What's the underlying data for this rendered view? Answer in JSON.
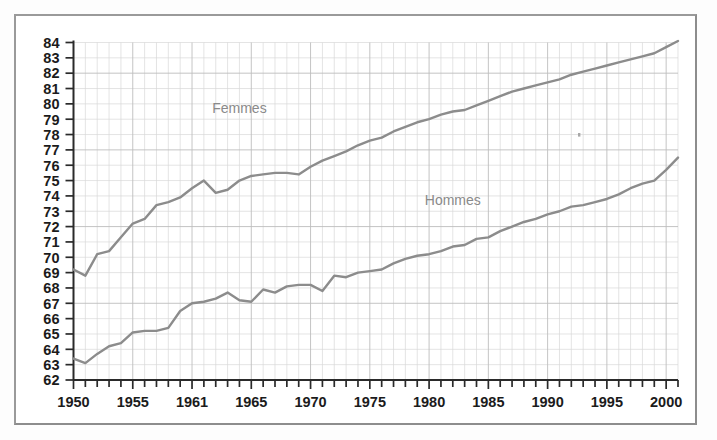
{
  "chart_data": {
    "type": "line",
    "title": "",
    "xlabel": "",
    "ylabel": "",
    "xlim": [
      1950,
      2001
    ],
    "ylim": [
      62,
      84
    ],
    "grid": true,
    "legend_position": "inline-annotation",
    "y_ticks": [
      62,
      63,
      64,
      65,
      66,
      67,
      68,
      69,
      70,
      71,
      72,
      73,
      74,
      75,
      76,
      77,
      78,
      79,
      80,
      81,
      82,
      83,
      84
    ],
    "y_tick_labels": [
      "62",
      "63",
      "64",
      "65",
      "66",
      "67",
      "68",
      "69",
      "70",
      "71",
      "72",
      "73",
      "74",
      "75",
      "76",
      "77",
      "78",
      "79",
      "80",
      "81",
      "82",
      "83",
      "84"
    ],
    "x_ticks": [
      1950,
      1955,
      1960,
      1965,
      1970,
      1975,
      1980,
      1985,
      1990,
      1995,
      2000
    ],
    "x_tick_labels": [
      "1950",
      "1955",
      "1961",
      "1965",
      "1970",
      "1975",
      "1980",
      "1985",
      "1990",
      "1995",
      "2000"
    ],
    "x_minor_tick_interval": 1,
    "x": [
      1950,
      1951,
      1952,
      1953,
      1954,
      1955,
      1956,
      1957,
      1958,
      1959,
      1960,
      1961,
      1962,
      1963,
      1964,
      1965,
      1966,
      1967,
      1968,
      1969,
      1970,
      1971,
      1972,
      1973,
      1974,
      1975,
      1976,
      1977,
      1978,
      1979,
      1980,
      1981,
      1982,
      1983,
      1984,
      1985,
      1986,
      1987,
      1988,
      1989,
      1990,
      1991,
      1992,
      1993,
      1994,
      1995,
      1996,
      1997,
      1998,
      1999,
      2000,
      2001
    ],
    "series": [
      {
        "name": "Femmes",
        "color": "#8c8c8c",
        "label_x": 1964,
        "label_y": 79.4,
        "values": [
          69.2,
          68.8,
          70.2,
          70.4,
          71.3,
          72.2,
          72.5,
          73.4,
          73.6,
          73.9,
          74.5,
          75.0,
          74.2,
          74.4,
          75.0,
          75.3,
          75.4,
          75.5,
          75.5,
          75.4,
          75.9,
          76.3,
          76.6,
          76.9,
          77.3,
          77.6,
          77.8,
          78.2,
          78.5,
          78.8,
          79.0,
          79.3,
          79.5,
          79.6,
          79.9,
          80.2,
          80.5,
          80.8,
          81.0,
          81.2,
          81.4,
          81.6,
          81.9,
          82.1,
          82.3,
          82.5,
          82.7,
          82.9,
          83.1,
          83.3,
          83.7,
          84.1
        ]
      },
      {
        "name": "Hommes",
        "color": "#8c8c8c",
        "label_x": 1982,
        "label_y": 73.4,
        "values": [
          63.4,
          63.1,
          63.7,
          64.2,
          64.4,
          65.1,
          65.2,
          65.2,
          65.4,
          66.5,
          67.0,
          67.1,
          67.3,
          67.7,
          67.2,
          67.1,
          67.9,
          67.7,
          68.1,
          68.2,
          68.2,
          67.8,
          68.8,
          68.7,
          69.0,
          69.1,
          69.2,
          69.6,
          69.9,
          70.1,
          70.2,
          70.4,
          70.7,
          70.8,
          71.2,
          71.3,
          71.7,
          72.0,
          72.3,
          72.5,
          72.8,
          73.0,
          73.3,
          73.4,
          73.6,
          73.8,
          74.1,
          74.5,
          74.8,
          75.0,
          75.7,
          76.5
        ]
      }
    ]
  }
}
